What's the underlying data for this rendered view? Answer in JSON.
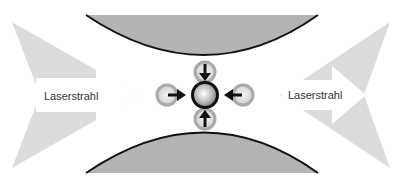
{
  "diagram": {
    "left_beam": {
      "label": "Laserstrahl",
      "direction": "right"
    },
    "right_beam": {
      "label": "Laserstrahl",
      "direction": "left"
    },
    "particle": {
      "name": "trapped-particle"
    },
    "forces": [
      "top",
      "left",
      "right",
      "bottom"
    ],
    "colors": {
      "beam": "#dcdcdc",
      "lens": "#b4b4b4",
      "lens_edge": "#111111",
      "satellite_ring": "#a9a9a9",
      "satellite_fill": "#dedede",
      "arrow": "#111111",
      "particle_ring": "#111111"
    }
  }
}
